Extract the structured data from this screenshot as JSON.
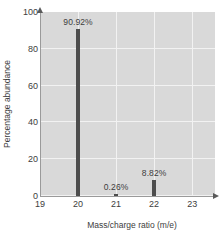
{
  "chart_data": {
    "type": "bar",
    "title": "",
    "xlabel": "Mass/charge ratio (m/e)",
    "ylabel": "Percentage abundance",
    "xlim": [
      19,
      23.6
    ],
    "ylim": [
      0,
      100
    ],
    "xticks": [
      19,
      20,
      21,
      22,
      23
    ],
    "xtick_labels": [
      "19",
      "20",
      "21",
      "22",
      "23"
    ],
    "yticks": [
      0,
      20,
      40,
      60,
      80,
      100
    ],
    "ytick_labels": [
      "0",
      "20",
      "40",
      "60",
      "80",
      "100"
    ],
    "grid": true,
    "legend": "none",
    "categories": [
      20,
      21,
      22
    ],
    "values": [
      90.92,
      0.26,
      8.82
    ],
    "point_labels": [
      "90.92%",
      "0.26%",
      "8.82%"
    ],
    "bar_color": "#4d4d4d",
    "plot_background": "#d9d9d9",
    "gridline_color": "#f2f2f2",
    "axis_color": "#9a9a9a",
    "points": [
      {
        "x": 20,
        "y": 90.92,
        "label": "90.92%"
      },
      {
        "x": 21,
        "y": 0.26,
        "label": "0.26%"
      },
      {
        "x": 22,
        "y": 8.82,
        "label": "8.82%"
      }
    ]
  }
}
